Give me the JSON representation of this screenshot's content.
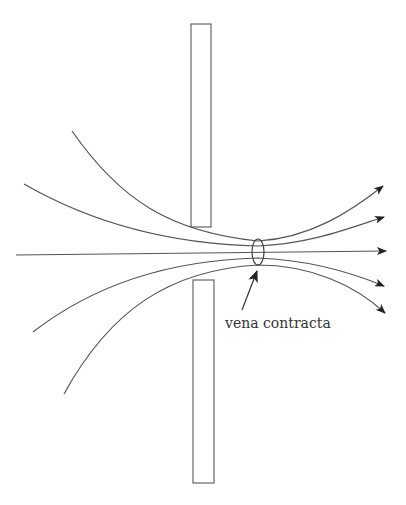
{
  "diagram": {
    "title": "",
    "annotation_label": "vena contracta",
    "stroke_color": "#555555",
    "arrow_color": "#222222",
    "components": {
      "orifice_plate_top": {
        "x": 191,
        "y": 24,
        "width": 20,
        "height": 203
      },
      "orifice_plate_bottom": {
        "x": 193,
        "y": 280,
        "width": 21,
        "height": 203
      },
      "vena_contracta_ellipse": {
        "cx": 258,
        "cy": 252,
        "rx": 6,
        "ry": 13
      }
    },
    "streamlines": [
      {
        "name": "streamline-1",
        "start": [
          72,
          131
        ],
        "end": [
          383,
          186
        ]
      },
      {
        "name": "streamline-2",
        "start": [
          24,
          184
        ],
        "end": [
          384,
          217
        ]
      },
      {
        "name": "streamline-center",
        "start": [
          16,
          255
        ],
        "end": [
          386,
          251
        ]
      },
      {
        "name": "streamline-4",
        "start": [
          33,
          332
        ],
        "end": [
          384,
          286
        ]
      },
      {
        "name": "streamline-5",
        "start": [
          64,
          394
        ],
        "end": [
          385,
          313
        ]
      }
    ]
  }
}
